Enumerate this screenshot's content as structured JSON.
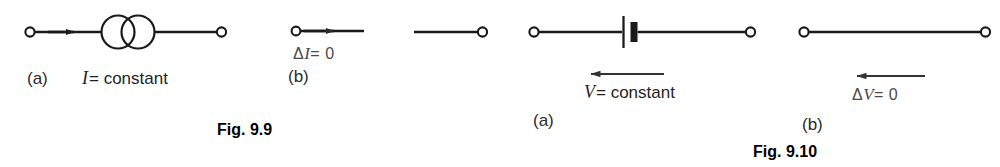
{
  "page": {
    "background_color": "#ffffff",
    "ink_color": "#1a1a1a",
    "muted_ink_color": "#4a4a4a"
  },
  "figures": [
    {
      "id": "fig-9-9",
      "caption": "Fig. 9.9",
      "panels": [
        {
          "key": "a",
          "label": "(a)",
          "symbol": "ideal-current-source",
          "expression": {
            "variable": "I",
            "relation": "= constant",
            "full": "I = constant"
          },
          "arrow_direction": "right"
        },
        {
          "key": "b",
          "label": "(b)",
          "symbol": "open-circuit-wire",
          "expression": {
            "variable": "I",
            "relation": "= 0",
            "full": "ΔI = 0",
            "delta": "Δ"
          },
          "arrow_direction": "right"
        }
      ]
    },
    {
      "id": "fig-9-10",
      "caption": "Fig. 9.10",
      "panels": [
        {
          "key": "a",
          "label": "(a)",
          "symbol": "ideal-voltage-source-battery",
          "expression": {
            "variable": "V",
            "relation": "= constant",
            "full": "V = constant"
          },
          "arrow_direction": "left"
        },
        {
          "key": "b",
          "label": "(b)",
          "symbol": "short-circuit-wire",
          "expression": {
            "variable": "V",
            "relation": "= 0",
            "full": "ΔV = 0",
            "delta": "Δ"
          },
          "arrow_direction": "left"
        }
      ]
    }
  ],
  "labels": {
    "fig99_a": "(a)",
    "fig99_a_expr_var": "I",
    "fig99_a_expr_rest": "= constant",
    "fig99_b": "(b)",
    "fig99_b_delta": "Δ",
    "fig99_b_var": "I",
    "fig99_b_rest": "= 0",
    "fig99_caption": "Fig. 9.9",
    "fig910_a": "(a)",
    "fig910_a_expr_var": "V",
    "fig910_a_expr_rest": "= constant",
    "fig910_b": "(b)",
    "fig910_b_delta": "Δ",
    "fig910_b_var": "V",
    "fig910_b_rest": "= 0",
    "fig910_caption": "Fig. 9.10"
  }
}
